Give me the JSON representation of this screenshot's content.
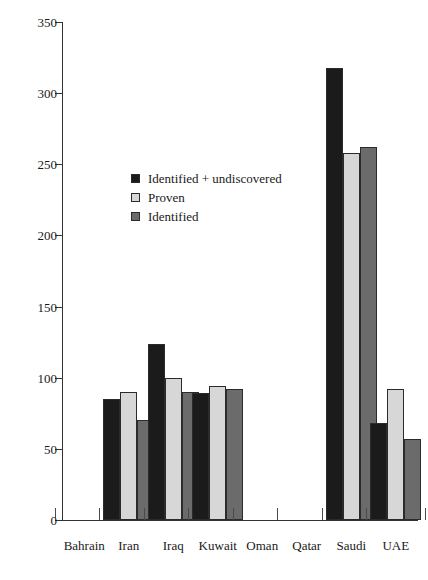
{
  "chart_data": {
    "type": "bar",
    "title": "",
    "subtitle": "",
    "xlabel": "",
    "ylabel": "",
    "ylim": [
      0,
      350
    ],
    "ytick_labels": [
      "0",
      "50",
      "100",
      "150",
      "200",
      "250",
      "300",
      "350"
    ],
    "yticks": [
      0,
      50,
      100,
      150,
      200,
      250,
      300,
      350
    ],
    "grid": false,
    "legend_position": "inside-upper-left",
    "categories": [
      "Bahrain",
      "Iran",
      "Iraq",
      "Kuwait",
      "Oman",
      "Qatar",
      "Saudi",
      "UAE"
    ],
    "series": [
      {
        "name": "Identified + undiscovered",
        "color": "#1b1b1b",
        "values": [
          0,
          85,
          124,
          89,
          0,
          0,
          318,
          68
        ]
      },
      {
        "name": "Proven",
        "color": "#d7d7d7",
        "values": [
          0,
          90,
          100,
          94,
          0,
          0,
          258,
          92
        ]
      },
      {
        "name": "Identified",
        "color": "#6b6b6b",
        "values": [
          0,
          70,
          90,
          92,
          0,
          0,
          262,
          57
        ]
      }
    ]
  },
  "axis": {
    "y_tick_labels": [
      "350",
      "300",
      "250",
      "200",
      "150",
      "100",
      "50",
      "0"
    ],
    "x_tick_labels": [
      "Bahrain",
      "Iran",
      "Iraq",
      "Kuwait",
      "Oman",
      "Qatar",
      "Saudi",
      "UAE"
    ]
  },
  "legend": {
    "items": [
      {
        "label": "Identified + undiscovered",
        "swatch": "s0"
      },
      {
        "label": "Proven",
        "swatch": "s1"
      },
      {
        "label": "Identified",
        "swatch": "s2"
      }
    ]
  }
}
